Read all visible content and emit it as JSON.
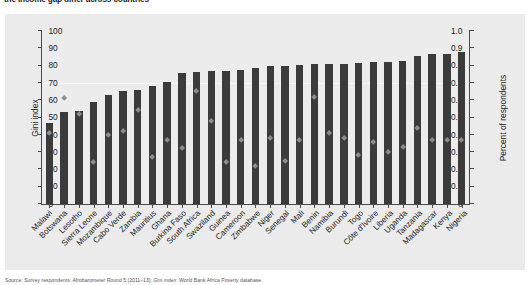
{
  "figure": {
    "title": "the income gap differ across countries",
    "source_note": "Source: Survey respondents: Afrobarometer Round 5 (2011–13); Gini index: World Bank Africa Poverty database."
  },
  "chart_data": {
    "type": "bar",
    "title": "the income gap differ across countries",
    "xlabel": "",
    "ylabel": "Gini index",
    "y2label": "Percent of respondents",
    "ylim": [
      0,
      1.0
    ],
    "y2lim": [
      0,
      100
    ],
    "yticks": [
      "0",
      "0.1",
      "0.2",
      "0.3",
      "0.4",
      "0.5",
      "0.6",
      "0.7",
      "0.8",
      "0.9",
      "1.0"
    ],
    "y2ticks": [
      "0",
      "10",
      "20",
      "30",
      "40",
      "50",
      "60",
      "70",
      "80",
      "90",
      "100"
    ],
    "grid": false,
    "legend": "none",
    "categories": [
      "Malawi",
      "Botswana",
      "Lesotho",
      "Sierra Leone",
      "Mozambique",
      "Cabo Verde",
      "Zambia",
      "Mauritius",
      "Ghana",
      "Burkina Faso",
      "South Africa",
      "Swaziland",
      "Guinea",
      "Cameroon",
      "Zimbabwe",
      "Niger",
      "Senegal",
      "Mali",
      "Benin",
      "Namibia",
      "Burundi",
      "Togo",
      "Côte d'Ivoire",
      "Liberia",
      "Uganda",
      "Tanzania",
      "Madagascar",
      "Kenya",
      "Nigeria"
    ],
    "series": [
      {
        "name": "Gini index",
        "type": "bar",
        "axis": "left",
        "color": "#3b3b3b",
        "values": [
          0.47,
          0.53,
          0.54,
          0.59,
          0.63,
          0.655,
          0.66,
          0.685,
          0.705,
          0.76,
          0.765,
          0.77,
          0.77,
          0.775,
          0.785,
          0.8,
          0.8,
          0.805,
          0.81,
          0.81,
          0.81,
          0.815,
          0.82,
          0.82,
          0.825,
          0.855,
          0.865,
          0.865,
          0.88
        ]
      },
      {
        "name": "Percent of respondents",
        "type": "scatter",
        "axis": "right",
        "color": "#8d8d8d",
        "marker": "diamond",
        "values": [
          41,
          61,
          52,
          24,
          40,
          42,
          54,
          27,
          37,
          32,
          65,
          48,
          24,
          37,
          22,
          38,
          25,
          37,
          62,
          41,
          38,
          28,
          36,
          30,
          33,
          44,
          37,
          37,
          37
        ]
      }
    ]
  }
}
